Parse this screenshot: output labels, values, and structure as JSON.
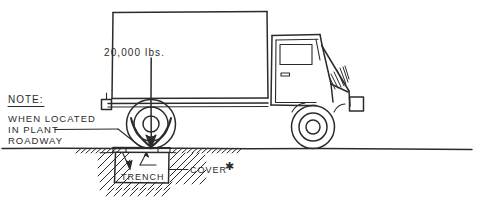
{
  "drawing": {
    "title_text_present": false,
    "labels": {
      "load": "20,000 lbs.",
      "note_heading": "NOTE:",
      "note_line_1": "WHEN LOCATED",
      "note_line_2": "IN PLANT",
      "note_line_3": "ROADWAY",
      "trench": "TRENCH",
      "cover": "COVER",
      "cover_footnote_mark": "✱"
    },
    "colors": {
      "ink": "#2b2b2b",
      "paper": "#ffffff"
    },
    "elements": {
      "vehicle": "delivery-truck-side-view",
      "load_arrow": "downward-load-arrow-through-rear-wheel",
      "ground": "ground-line-with-section-hatching",
      "void": "rectangular-trench-below-grade",
      "slab": "trench-cover-plate-at-grade"
    }
  }
}
